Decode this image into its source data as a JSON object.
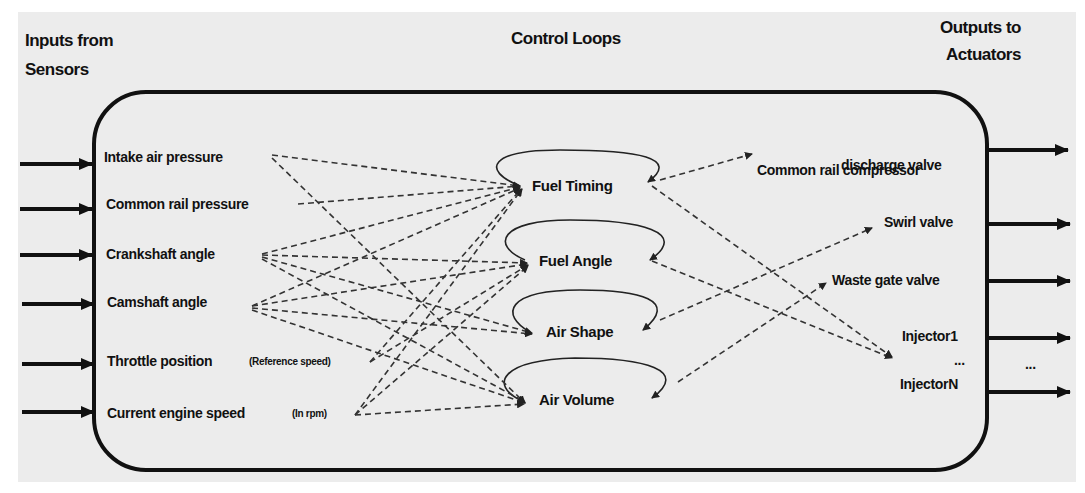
{
  "headers": {
    "inputs_line1": "Inputs from",
    "inputs_line2": "Sensors",
    "control": "Control Loops",
    "outputs_line1": "Outputs to",
    "outputs_line2": "Actuators"
  },
  "inputs": [
    {
      "label": "Intake air pressure",
      "note": ""
    },
    {
      "label": "Common rail pressure",
      "note": ""
    },
    {
      "label": "Crankshaft angle",
      "note": ""
    },
    {
      "label": "Camshaft angle",
      "note": ""
    },
    {
      "label": "Throttle position",
      "note": "(Reference speed)"
    },
    {
      "label": "Current engine speed",
      "note": "(In rpm)"
    }
  ],
  "loops": [
    {
      "label": "Fuel Timing"
    },
    {
      "label": "Fuel Angle"
    },
    {
      "label": "Air Shape"
    },
    {
      "label": "Air Volume"
    }
  ],
  "outputs": [
    {
      "label": "Common rail compressor",
      "label2": "discharge valve"
    },
    {
      "label": "Swirl valve"
    },
    {
      "label": "Waste gate valve"
    },
    {
      "label": "Injector1"
    },
    {
      "label": "..."
    },
    {
      "label": "InjectorN"
    }
  ],
  "outputs_ellipsis": "...",
  "colors": {
    "background": "#ececec",
    "line": "#111111",
    "dashed": "#333333"
  }
}
